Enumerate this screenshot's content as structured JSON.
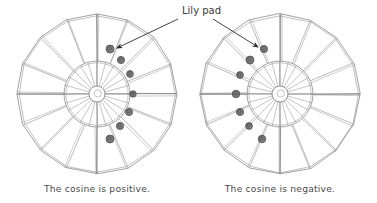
{
  "figure": {
    "title_label": "Lily pad",
    "background_color": "#ffffff",
    "ink_color": "#8a8a8a",
    "text_color": "#4a4a4a",
    "lilypad_fill": "#6e6e6e",
    "lilypad_stroke": "#3c3c3c"
  },
  "annotation": {
    "label": "Lily pad",
    "label_x": 182,
    "label_y": 14,
    "arrows": [
      {
        "name": "arrow-to-left-wheel-pad",
        "x1": 178,
        "y1": 19,
        "x2": 117,
        "y2": 48
      },
      {
        "name": "arrow-to-right-wheel-pad",
        "x1": 213,
        "y1": 19,
        "x2": 258,
        "y2": 47
      }
    ]
  },
  "wheels": [
    {
      "id": "left",
      "caption": "The cosine is positive.",
      "caption_x": 97,
      "caption_y": 192,
      "center_x": 97,
      "center_y": 94,
      "outer_radius": 80,
      "inner_radius": 33,
      "hub_radius": 8,
      "rim_sides": 16,
      "spoke_count": 16,
      "inner_spoke_count": 24,
      "pads_side": "right",
      "pads": [
        {
          "x": 110,
          "y": 49,
          "r": 4.0
        },
        {
          "x": 121,
          "y": 60,
          "r": 3.6
        },
        {
          "x": 130,
          "y": 74,
          "r": 3.4
        },
        {
          "x": 133,
          "y": 94,
          "r": 3.2
        },
        {
          "x": 129,
          "y": 112,
          "r": 3.6
        },
        {
          "x": 120,
          "y": 126,
          "r": 3.6
        },
        {
          "x": 110,
          "y": 139,
          "r": 4.0
        }
      ]
    },
    {
      "id": "right",
      "caption": "The cosine is negative.",
      "caption_x": 280,
      "caption_y": 192,
      "center_x": 280,
      "center_y": 94,
      "outer_radius": 80,
      "inner_radius": 33,
      "hub_radius": 8,
      "rim_sides": 16,
      "spoke_count": 16,
      "inner_spoke_count": 24,
      "pads_side": "left",
      "pads": [
        {
          "x": 264,
          "y": 49,
          "r": 3.6
        },
        {
          "x": 250,
          "y": 60,
          "r": 4.0
        },
        {
          "x": 240,
          "y": 75,
          "r": 3.4
        },
        {
          "x": 236,
          "y": 94,
          "r": 3.8
        },
        {
          "x": 240,
          "y": 112,
          "r": 3.6
        },
        {
          "x": 249,
          "y": 126,
          "r": 3.4
        },
        {
          "x": 262,
          "y": 139,
          "r": 3.8
        }
      ]
    }
  ],
  "chart_data": {
    "type": "diagram",
    "panels": [
      {
        "label": "The cosine is positive.",
        "pad_count": 7,
        "pad_side": "right",
        "spoke_count": 16
      },
      {
        "label": "The cosine is negative.",
        "pad_count": 7,
        "pad_side": "left",
        "spoke_count": 16
      }
    ]
  }
}
